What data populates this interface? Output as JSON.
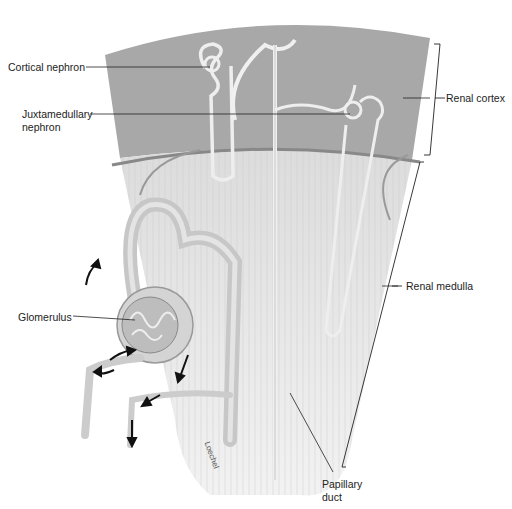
{
  "diagram": {
    "labels": {
      "cortical_nephron": "Cortical nephron",
      "juxtamedullary_line1": "Juxtamedullary",
      "juxtamedullary_line2": "nephron",
      "renal_cortex": "Renal cortex",
      "renal_medulla": "Renal medulla",
      "glomerulus": "Glomerulus",
      "papillary_line1": "Papillary",
      "papillary_line2": "duct"
    },
    "signature": "Loechel",
    "colors": {
      "cortex": "#a8a8a8",
      "medulla": "#e6e6e6",
      "tubule": "#d2d2d2",
      "leader_line": "#222222"
    }
  }
}
